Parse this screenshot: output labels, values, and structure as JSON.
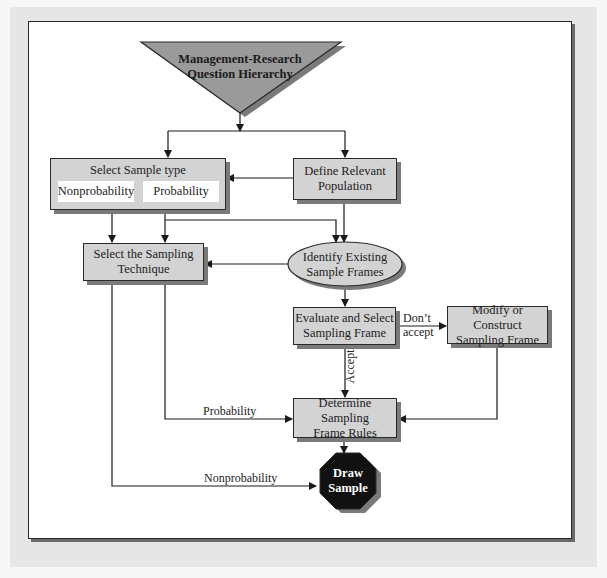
{
  "diagram": {
    "top": {
      "line1": "Management-Research",
      "line2": "Question Hierarchy"
    },
    "select_sample_type": {
      "title": "Select Sample type",
      "options": [
        "Nonprobability",
        "Probability"
      ]
    },
    "define_population": {
      "line1": "Define Relevant",
      "line2": "Population"
    },
    "select_technique": {
      "line1": "Select the Sampling",
      "line2": "Technique"
    },
    "identify_frames": {
      "line1": "Identify Existing",
      "line2": "Sample Frames"
    },
    "evaluate_frame": {
      "line1": "Evaluate and Select",
      "line2": "Sampling Frame"
    },
    "modify_frame": {
      "line1": "Modify or Construct",
      "line2": "Sampling Frame"
    },
    "determine_rules": {
      "line1": "Determine Sampling",
      "line2": "Frame Rules"
    },
    "draw_sample": {
      "line1": "Draw",
      "line2": "Sample"
    },
    "edge_labels": {
      "dont_accept_1": "Don’t",
      "dont_accept_2": "accept",
      "accept": "Accept",
      "probability": "Probability",
      "nonprobability": "Nonprobability"
    },
    "colors": {
      "box_fill": "#d3d3d3",
      "shadow": "#7a7a7a",
      "stroke": "#2a2a2a",
      "terminal_fill": "#111111",
      "triangle_fill": "#9a9a9a",
      "frame_bg": "#e6e6e6"
    }
  }
}
